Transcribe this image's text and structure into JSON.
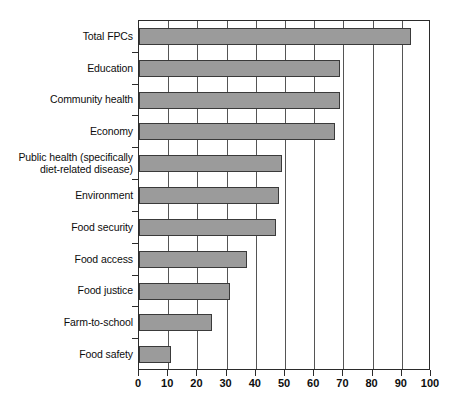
{
  "chart_data": {
    "type": "bar",
    "orientation": "horizontal",
    "title": "",
    "xlabel": "",
    "ylabel": "",
    "xlim": [
      0,
      100
    ],
    "xticks": [
      0,
      10,
      20,
      30,
      40,
      50,
      60,
      70,
      80,
      90,
      100
    ],
    "xtick_labels": [
      "0",
      "10",
      "20",
      "30",
      "40",
      "50",
      "60",
      "70",
      "80",
      "90",
      "100"
    ],
    "grid": "vertical",
    "legend": "none",
    "categories": [
      "Total FPCs",
      "Education",
      "Community health",
      "Economy",
      "Public health (specifically\ndiet-related disease)",
      "Environment",
      "Food security",
      "Food access",
      "Food justice",
      "Farm-to-school",
      "Food safety"
    ],
    "values": [
      93,
      69,
      69,
      67,
      49,
      48,
      47,
      37,
      31,
      25,
      11
    ],
    "series": [
      {
        "name": "Food Policy Councils",
        "values": [
          93,
          69,
          69,
          67,
          49,
          48,
          47,
          37,
          31,
          25,
          11
        ]
      }
    ]
  },
  "style": {
    "bar_fill": "#9b9b9b",
    "bar_stroke": "#3a3a3a",
    "axis_color": "#2b2b2b",
    "grid_color": "#555555",
    "background": "#ffffff",
    "text_color": "#0d0d0d"
  }
}
